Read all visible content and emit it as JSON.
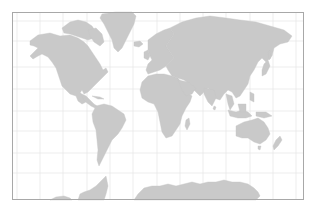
{
  "map": {
    "projection": "Mercator",
    "graticule_step_degrees": 30,
    "colors": {
      "background": "#ffffff",
      "land": "#c9c9c9",
      "graticule": "#e9e9e9",
      "frame": "#a8a8a8"
    },
    "frame": {
      "x": 12,
      "y": 12,
      "width": 292,
      "height": 188
    },
    "graticule": {
      "meridians_x": [
        17,
        40,
        63,
        87,
        110,
        133,
        157,
        180,
        203,
        226,
        250,
        273,
        296
      ],
      "parallels_y": [
        21,
        41,
        67,
        89,
        111,
        131,
        153,
        173
      ]
    },
    "landmasses": [
      "North America",
      "Greenland",
      "South America",
      "Europe",
      "Africa",
      "Asia",
      "Australia",
      "New Zealand",
      "Antarctica",
      "Madagascar",
      "Japan",
      "Indonesia",
      "British Isles",
      "Iceland",
      "Arctic Archipelago",
      "Caribbean",
      "Sri Lanka",
      "New Guinea",
      "Philippines"
    ]
  }
}
